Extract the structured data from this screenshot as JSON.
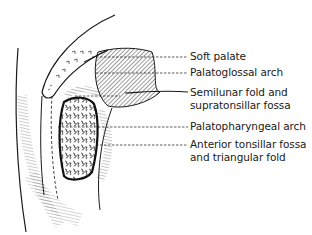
{
  "figure": {
    "type": "anatomical line illustration",
    "colors": {
      "ink": "#1a1a1a",
      "background": "#ffffff"
    }
  },
  "labels": [
    {
      "id": "soft-palate",
      "lines": [
        "Soft palate"
      ]
    },
    {
      "id": "palatoglossal-arch",
      "lines": [
        "Palatoglossal arch"
      ]
    },
    {
      "id": "semilunar-fold",
      "lines": [
        "Semilunar fold and",
        "supratonsillar fossa"
      ]
    },
    {
      "id": "palatopharyngeal-arch",
      "lines": [
        "Palatopharyngeal arch"
      ]
    },
    {
      "id": "anterior-tonsillar-fossa",
      "lines": [
        "Anterior tonsillar fossa",
        "and triangular fold"
      ]
    }
  ]
}
